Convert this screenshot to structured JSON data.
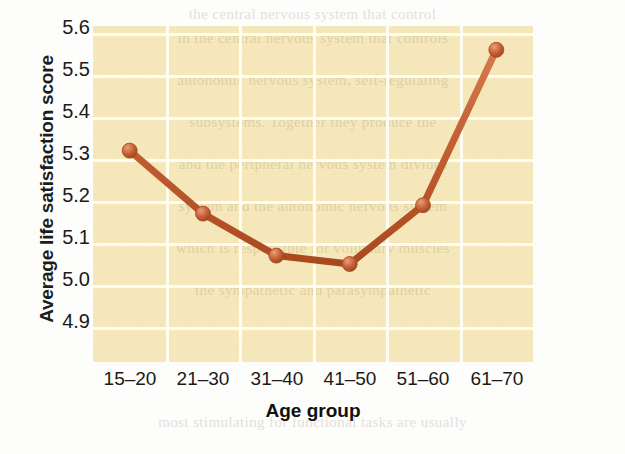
{
  "chart_data": {
    "type": "line",
    "title": "",
    "xlabel": "Age group",
    "ylabel": "Average life satisfaction score",
    "categories": [
      "15–20",
      "21–30",
      "31–40",
      "41–50",
      "51–60",
      "61–70"
    ],
    "values": [
      5.32,
      5.17,
      5.07,
      5.05,
      5.19,
      5.56
    ],
    "ylim": [
      4.85,
      5.65
    ],
    "yticks": [
      "5.6",
      "5.5",
      "5.4",
      "5.3",
      "5.2",
      "5.1",
      "5.0",
      "4.9"
    ],
    "ytick_values": [
      5.6,
      5.5,
      5.4,
      5.3,
      5.2,
      5.1,
      5.0,
      4.9
    ],
    "grid": true,
    "legend": "none",
    "series": [
      {
        "name": "Average life satisfaction score",
        "values": [
          5.32,
          5.17,
          5.07,
          5.05,
          5.19,
          5.56
        ]
      }
    ]
  },
  "style": {
    "line_color": "#c0562f",
    "line_highlight": "#d9825a",
    "marker_color": "#c0562f",
    "plot_background": "#f6e7b8",
    "gridline_color": "#fffdf4",
    "page_background": "#ffffff",
    "text_color": "#1a1a1a"
  },
  "background_text": {
    "outer_lines": [
      "the central nervous system that control",
      "stimuli. It consists of both the peripheral",
      "the peripheral nerves that run through the body.",
      "nervous",
      "peripheral nervous system consists of the",
      "the somatic and autonomic divisions.",
      "voluntary movements of skeletal muscles.",
      "and the other governs the processes of ",
      "the parasympathetic process and",
      "the involuntary processes. The cen",
      "and the involuntary processes, the car",
      "most stimulating for functional tasks are usually"
    ],
    "inner_lines": [
      "in the central nervous system that controls",
      "autonomic nervous system, self-regulating",
      "subsystems. Together they produce the",
      "and the peripheral nervous system divides",
      "system and the autonomic nervous system",
      "which is responsible for voluntary muscles",
      "the sympathetic and parasympathetic"
    ]
  }
}
